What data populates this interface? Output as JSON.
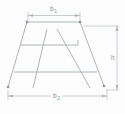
{
  "diagram": {
    "kind": "technical line drawing",
    "dimensions": {
      "top_width": {
        "base": "b",
        "sub": "1"
      },
      "bottom_width": {
        "base": "b",
        "sub": "2"
      },
      "height": {
        "label": "h"
      }
    }
  },
  "colors": {
    "structure_line": "#a6abb1",
    "dimension_line": "#b2b7bd",
    "corner_dot": "#8f959b",
    "label_text": "#8a9095",
    "background": "#fdfdfd"
  }
}
